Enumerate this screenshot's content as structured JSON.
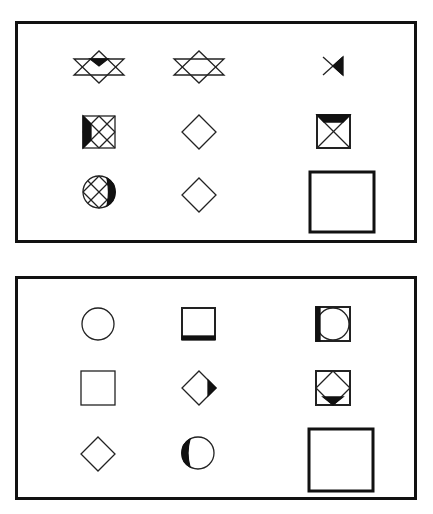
{
  "puzzle": {
    "panels": [
      {
        "id": "problem",
        "rows": [
          [
            "star-of-david-with-filled-top-triangle",
            "star-of-david",
            "bowtie-with-filled-right-triangle"
          ],
          [
            "crosshatched-square-with-filled-left-strip",
            "diamond",
            "square-x-with-filled-top-triangle"
          ],
          [
            "crosshatched-circle-with-filled-right-crescent",
            "diamond",
            "answer-blank-square"
          ]
        ]
      },
      {
        "id": "options",
        "rows": [
          [
            "circle",
            "square-with-thick-bottom",
            "square-with-inscribed-circle-filled-left"
          ],
          [
            "square",
            "diamond-with-filled-right-tip",
            "square-with-inscribed-diamond-filled-bottom"
          ],
          [
            "diamond",
            "circle-with-filled-left-crescent",
            "answer-blank-square"
          ]
        ]
      }
    ]
  }
}
